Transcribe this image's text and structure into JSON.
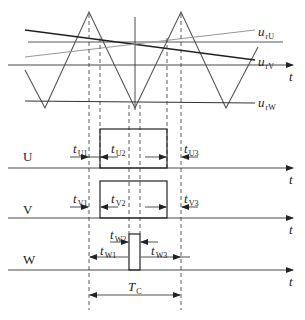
{
  "diagram": {
    "type": "SVPWM carrier comparison timing diagram",
    "carrier": {
      "shape": "triangle",
      "peaks_x": [
        89,
        181
      ],
      "valleys_x": [
        45,
        135,
        226
      ]
    },
    "references": [
      {
        "name": "u_rU",
        "label_main": "u",
        "label_sub": "rU",
        "color": "#8a8a8a"
      },
      {
        "name": "u_rV",
        "label_main": "u",
        "label_sub": "rV",
        "color": "#222222"
      },
      {
        "name": "u_rW",
        "label_main": "u",
        "label_sub": "rW",
        "color": "#333333"
      }
    ],
    "axis_label": "t",
    "phases": [
      {
        "name": "U",
        "intervals": [
          {
            "main": "t",
            "sub": "U1"
          },
          {
            "main": "t",
            "sub": "U2"
          },
          {
            "main": "t",
            "sub": "U3"
          }
        ]
      },
      {
        "name": "V",
        "intervals": [
          {
            "main": "t",
            "sub": "V1"
          },
          {
            "main": "t",
            "sub": "V2"
          },
          {
            "main": "t",
            "sub": "V3"
          }
        ]
      },
      {
        "name": "W",
        "intervals": [
          {
            "main": "t",
            "sub": "W1"
          },
          {
            "main": "t",
            "sub": "W2"
          },
          {
            "main": "t",
            "sub": "W3"
          }
        ]
      }
    ],
    "period": {
      "main": "T",
      "sub": "C"
    }
  }
}
